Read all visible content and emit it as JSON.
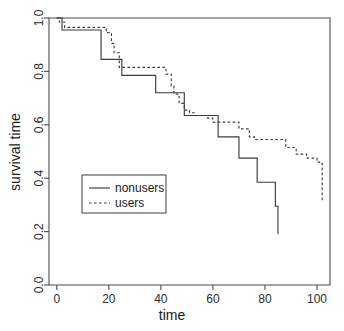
{
  "chart_data": {
    "type": "line",
    "title": "",
    "subtitle": "",
    "xlabel": "time",
    "ylabel": "survival time",
    "xlim": [
      -3,
      105
    ],
    "ylim": [
      0.0,
      1.0
    ],
    "grid": false,
    "legend_position": "center-left",
    "x_ticks": [
      0,
      20,
      40,
      60,
      80,
      100
    ],
    "x_tick_labels": [
      "0",
      "20",
      "40",
      "60",
      "80",
      "100"
    ],
    "y_ticks": [
      0.0,
      0.2,
      0.4,
      0.6,
      0.8,
      1.0
    ],
    "y_tick_labels": [
      "0.0",
      "0.2",
      "0.4",
      "0.6",
      "0.8",
      "1.0"
    ],
    "series": [
      {
        "name": "nonusers",
        "style": "solid",
        "color": "#3c3c3c",
        "step_type": "post",
        "x": [
          0,
          2,
          15,
          17,
          23,
          25,
          36,
          38,
          47,
          49,
          60,
          62,
          68,
          70,
          75,
          77,
          84,
          85
        ],
        "y": [
          1.0,
          0.955,
          0.955,
          0.845,
          0.845,
          0.785,
          0.785,
          0.72,
          0.72,
          0.635,
          0.635,
          0.555,
          0.555,
          0.475,
          0.475,
          0.385,
          0.295,
          0.19
        ]
      },
      {
        "name": "users",
        "style": "dashed",
        "color": "#3c3c3c",
        "step_type": "post",
        "x": [
          0,
          1,
          3,
          17,
          19,
          21,
          22,
          24,
          40,
          42,
          44,
          45,
          47,
          49,
          51,
          53,
          56,
          58,
          60,
          68,
          70,
          74,
          76,
          86,
          88,
          92,
          96,
          100,
          101,
          102
        ],
        "y": [
          1.0,
          0.985,
          0.965,
          0.965,
          0.945,
          0.905,
          0.87,
          0.815,
          0.815,
          0.79,
          0.745,
          0.715,
          0.68,
          0.655,
          0.645,
          0.635,
          0.635,
          0.625,
          0.61,
          0.61,
          0.585,
          0.555,
          0.545,
          0.545,
          0.515,
          0.49,
          0.475,
          0.46,
          0.455,
          0.31
        ]
      }
    ],
    "legend_entries": [
      {
        "label": "nonusers",
        "style": "solid"
      },
      {
        "label": "users",
        "style": "dashed"
      }
    ]
  }
}
